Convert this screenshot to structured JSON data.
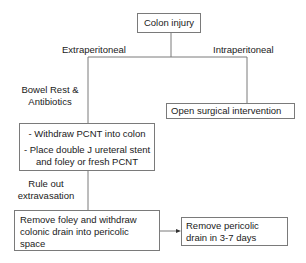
{
  "nodes": {
    "root": "Colon injury",
    "open_surgery": "Open surgical intervention",
    "pcnt_step1": "- Withdraw PCNT into colon",
    "pcnt_step2_line1": "- Place double J ureteral stent",
    "pcnt_step2_line2": "and foley or fresh PCNT",
    "remove_foley_line1": "Remove foley and withdraw",
    "remove_foley_line2": "colonic drain into pericolic",
    "remove_foley_line3": "space",
    "remove_drain_line1": "Remove pericolic",
    "remove_drain_line2": "drain in 3-7 days"
  },
  "edge_labels": {
    "extraperitoneal": "Extraperitoneal",
    "intraperitoneal": "Intraperitoneal",
    "bowel_rest_line1": "Bowel Rest &",
    "bowel_rest_line2": "Antibiotics",
    "rule_out_line1": "Rule out",
    "rule_out_line2": "extravasation"
  },
  "colors": {
    "line": "#7a7a7a",
    "text": "#1a1a1a",
    "background": "#ffffff"
  }
}
